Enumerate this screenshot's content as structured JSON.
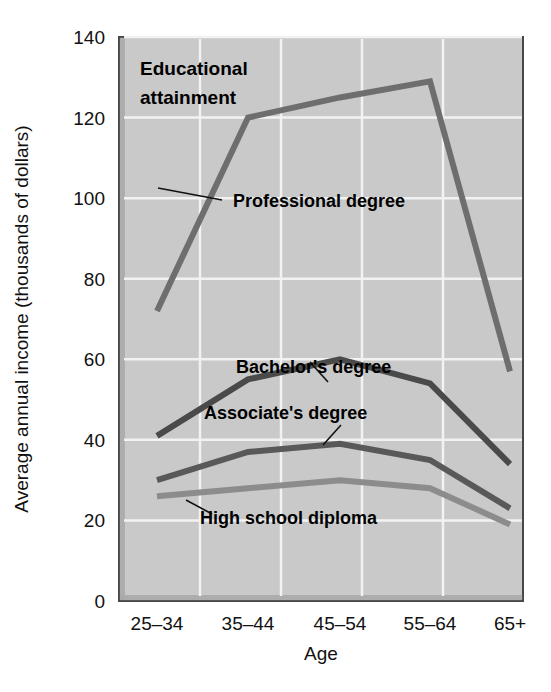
{
  "chart_data": {
    "type": "line",
    "title": "",
    "annotation_title": "Educational attainment",
    "annotation_title_line1": "Educational",
    "annotation_title_line2": "attainment",
    "xlabel": "Age",
    "ylabel": "Average annual income (thousands of dollars)",
    "categories": [
      "25–34",
      "35–44",
      "45–54",
      "55–64",
      "65+"
    ],
    "ylim": [
      0,
      140
    ],
    "yticks": [
      0,
      20,
      40,
      60,
      80,
      100,
      120,
      140
    ],
    "ytick_labels": [
      "0",
      "20",
      "40",
      "60",
      "80",
      "100",
      "120",
      "140"
    ],
    "grid": true,
    "legend_position": "inline-annotations",
    "plot_background": "#c9c9c9",
    "grid_color": "#f2f2f2",
    "series": [
      {
        "name": "Professional degree",
        "color": "#6e6e6e",
        "values": [
          72,
          120,
          125,
          129,
          57
        ],
        "label_x": 233,
        "label_y": 207,
        "leader": [
          158,
          188,
          222,
          200
        ]
      },
      {
        "name": "Bachelor's degree",
        "color": "#4a4a4a",
        "values": [
          41,
          55,
          60,
          54,
          34
        ],
        "label_x": 236,
        "label_y": 373,
        "leader": [
          328,
          382,
          310,
          362
        ]
      },
      {
        "name": "Associate's degree",
        "color": "#595959",
        "values": [
          30,
          37,
          39,
          35,
          23
        ],
        "label_x": 204,
        "label_y": 419,
        "leader": [
          323,
          445,
          341,
          425
        ]
      },
      {
        "name": "High school diploma",
        "color": "#8c8c8c",
        "values": [
          26,
          28,
          30,
          28,
          19
        ],
        "label_x": 200,
        "label_y": 524,
        "leader": [
          186,
          500,
          212,
          514
        ]
      }
    ]
  }
}
